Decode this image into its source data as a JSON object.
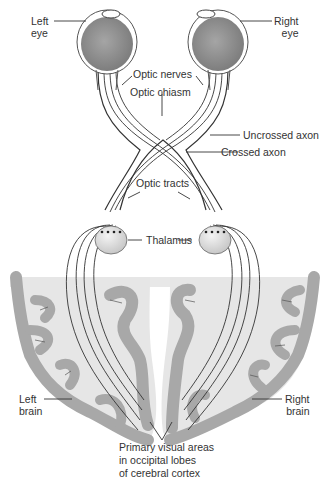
{
  "diagram": {
    "labels": {
      "left_eye": [
        "Left",
        "eye"
      ],
      "right_eye": [
        "Right",
        "eye"
      ],
      "optic_nerves": "Optic nerves",
      "optic_chiasm": "Optic chiasm",
      "uncrossed_axon": "Uncrossed axon",
      "crossed_axon": "Crossed axon",
      "optic_tracts": "Optic tracts",
      "thalamus": "Thalamus",
      "left_brain": [
        "Left",
        "brain"
      ],
      "right_brain": [
        "Right",
        "brain"
      ],
      "primary_visual": [
        "Primary visual areas",
        "in occipital lobes",
        "of cerebral cortex"
      ]
    },
    "colors": {
      "eyeball": "#8a8a8a",
      "cortex_gray": "#a8a8a8",
      "white_matter": "#e6e6e6",
      "thalamus": "#d8d8d8",
      "line": "#333333"
    }
  }
}
